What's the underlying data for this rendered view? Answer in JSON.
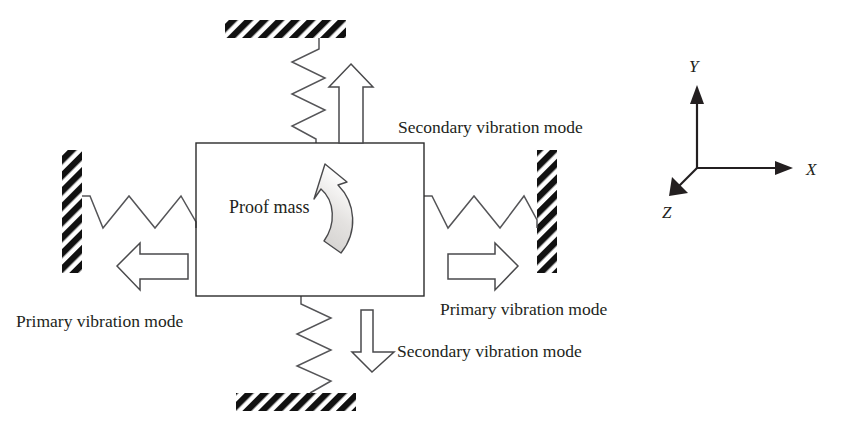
{
  "figure": {
    "type": "mechanical-schematic"
  },
  "labels": {
    "proof_mass": "Proof mass",
    "secondary_top": "Secondary vibration mode",
    "secondary_bottom": "Secondary vibration mode",
    "primary_left": "Primary vibration mode",
    "primary_right": "Primary vibration mode"
  },
  "axes": {
    "x_label": "X",
    "y_label": "Y",
    "z_label": "Z"
  },
  "colors": {
    "ink": "#231f20",
    "outline": "#2b2b2b",
    "spring": "#555558",
    "arrow_stroke": "#4a4a4c",
    "rotation_fill": "#d4d2d0",
    "background": "#ffffff"
  },
  "components": {
    "proof_mass_box": {
      "x": 196,
      "y": 143,
      "width": 228,
      "height": 153
    },
    "walls": [
      {
        "name": "top-wall",
        "x": 225,
        "y": 20,
        "width": 121,
        "height": 18,
        "orientation": "horizontal"
      },
      {
        "name": "bottom-wall",
        "x": 236,
        "y": 393,
        "width": 120,
        "height": 18,
        "orientation": "horizontal"
      },
      {
        "name": "left-wall",
        "x": 62,
        "y": 150,
        "width": 20,
        "height": 122,
        "orientation": "vertical"
      },
      {
        "name": "right-wall",
        "x": 537,
        "y": 150,
        "width": 20,
        "height": 122,
        "orientation": "vertical"
      }
    ],
    "springs": [
      {
        "name": "top-spring",
        "orientation": "vertical",
        "coils": 4
      },
      {
        "name": "bottom-spring",
        "orientation": "vertical",
        "coils": 4
      },
      {
        "name": "left-spring",
        "orientation": "horizontal",
        "coils": 4
      },
      {
        "name": "right-spring",
        "orientation": "horizontal",
        "coils": 4
      }
    ],
    "arrows": [
      {
        "name": "up-arrow",
        "direction": "up",
        "mode": "secondary"
      },
      {
        "name": "down-arrow",
        "direction": "down",
        "mode": "secondary"
      },
      {
        "name": "left-arrow",
        "direction": "left",
        "mode": "primary"
      },
      {
        "name": "right-arrow",
        "direction": "right",
        "mode": "primary"
      },
      {
        "name": "rotation-arrow",
        "direction": "counterclockwise",
        "mode": "rotation"
      }
    ]
  }
}
